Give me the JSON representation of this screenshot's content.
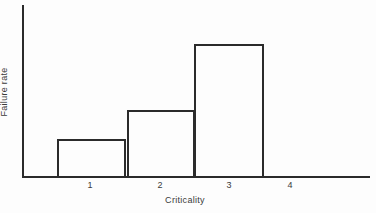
{
  "chart_data": {
    "type": "bar",
    "title": "",
    "xlabel": "Criticality",
    "ylabel": "Failure rate",
    "categories": [
      "1",
      "2",
      "3",
      "4"
    ],
    "values": [
      38,
      67,
      133,
      0
    ],
    "ylim": [
      0,
      172
    ],
    "xlim": [
      0.5,
      4.5
    ],
    "grid": false,
    "legend": null,
    "axis_tick_labels_y": []
  },
  "style": {
    "line_color": "#2b2b2b",
    "text_color": "#3a3a3a",
    "background": "#fdfdfd"
  },
  "geometry": {
    "plot_left": 22,
    "baseline_y": 177,
    "axis_top_y": 5,
    "axis_right_x": 370,
    "bars": [
      {
        "left": 57,
        "width": 69,
        "top": 139
      },
      {
        "left": 127,
        "width": 68,
        "top": 110
      },
      {
        "left": 194,
        "width": 70,
        "top": 44
      }
    ],
    "tick_x": [
      90,
      160,
      229,
      290
    ]
  }
}
